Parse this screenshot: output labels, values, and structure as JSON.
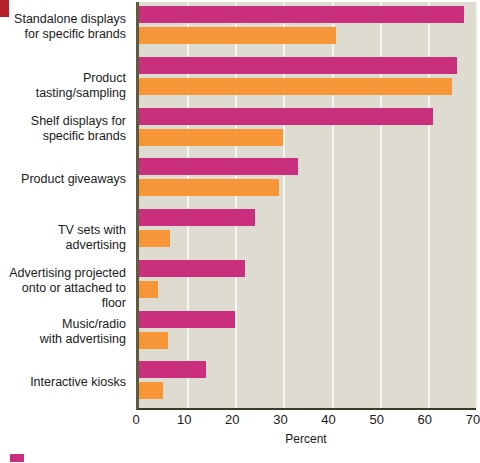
{
  "chart_data": {
    "type": "bar",
    "orientation": "horizontal",
    "title": "",
    "xlabel": "Percent",
    "ylabel": "",
    "xlim": [
      0,
      70
    ],
    "xticks": [
      0,
      10,
      20,
      30,
      40,
      50,
      60,
      70
    ],
    "grid": true,
    "legend_position": "bottom-left",
    "categories": [
      "Standalone displays\nfor specific brands",
      "Product tasting/sampling",
      "Shelf displays for\nspecific brands",
      "Product giveaways",
      "TV sets with advertising",
      "Advertising projected\nonto or attached to floor",
      "Music/radio\nwith advertising",
      "Interactive kiosks"
    ],
    "series": [
      {
        "name": "series-1",
        "color": "#c92f7d",
        "values": [
          67.5,
          66,
          61,
          33,
          24,
          22,
          20,
          14
        ]
      },
      {
        "name": "series-2",
        "color": "#f79638",
        "values": [
          41,
          65,
          30,
          29,
          6.5,
          4,
          6,
          5
        ]
      }
    ]
  },
  "legend": {
    "items": [
      {
        "swatch_color": "#c92f7d",
        "label": ""
      }
    ]
  },
  "colors": {
    "series_1": "#c92f7d",
    "series_2": "#f79638",
    "plot_background": "#dedcd0",
    "gridline": "#f6f5ef",
    "axis": "#3a3a2a",
    "corner_marker": "#b5212b",
    "text": "#1a1a1a"
  }
}
